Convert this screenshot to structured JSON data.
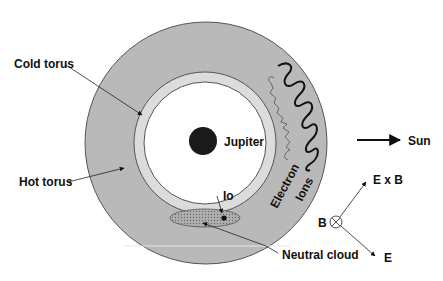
{
  "diagram": {
    "labels": {
      "cold_torus": "Cold torus",
      "hot_torus": "Hot torus",
      "jupiter": "Jupiter",
      "io": "Io",
      "neutral_cloud": "Neutral cloud",
      "electron": "Electron",
      "ions": "Ions",
      "sun": "Sun",
      "exb": "E x B",
      "b": "B",
      "e": "E"
    },
    "colors": {
      "hot_torus_fill": "#b9b9b9",
      "cold_torus_fill": "#dcdcdc",
      "interior_fill": "#ffffff",
      "jupiter_fill": "#1a1a1a",
      "outline": "#555555",
      "neutral_cloud_fill": "#a8a8a8",
      "text": "#111111"
    }
  }
}
